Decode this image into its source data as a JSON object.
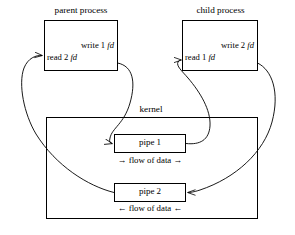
{
  "diagram": {
    "title_parent": "parent process",
    "title_child": "child process",
    "title_kernel": "kernel",
    "parent": {
      "write_label_text": "write 1 ",
      "write_label_em": "fd",
      "read_label_text": "read 2 ",
      "read_label_em": "fd"
    },
    "child": {
      "write_label_text": "write 2 ",
      "write_label_em": "fd",
      "read_label_text": "read 1 ",
      "read_label_em": "fd"
    },
    "pipes": [
      {
        "name": "pipe 1",
        "flow": "→ flow of data →"
      },
      {
        "name": "pipe 2",
        "flow": "← flow of data ←"
      }
    ],
    "colors": {
      "stroke": "#000000",
      "background": "#ffffff",
      "text": "#000000"
    }
  }
}
